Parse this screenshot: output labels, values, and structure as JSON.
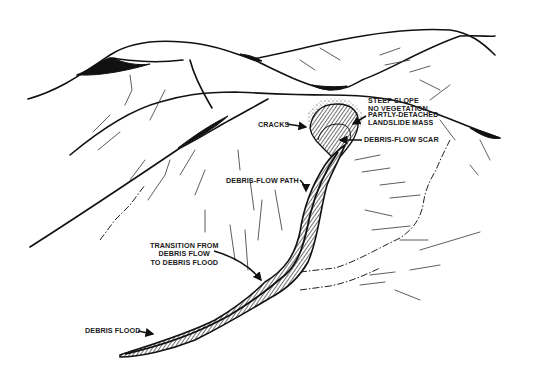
{
  "diagram": {
    "ink_color": "#111111",
    "background": "#ffffff",
    "labels": [
      {
        "id": "steep-slope",
        "text": "STEEP SLOPE\nNO VEGETATION",
        "x": 368,
        "y": 97
      },
      {
        "id": "cracks",
        "text": "CRACKS",
        "x": 258,
        "y": 121
      },
      {
        "id": "partly-detached",
        "text": "PARTLY-DETACHED\nLANDSLIDE MASS",
        "x": 368,
        "y": 111
      },
      {
        "id": "debris-flow-scar",
        "text": "DEBRIS-FLOW SCAR",
        "x": 364,
        "y": 137
      },
      {
        "id": "debris-flow-path",
        "text": "DEBRIS-FLOW PATH",
        "x": 226,
        "y": 178
      },
      {
        "id": "transition",
        "text": "TRANSITION FROM\nDEBRIS FLOW\nTO DEBRIS FLOOD",
        "x": 150,
        "y": 243
      },
      {
        "id": "debris-flood",
        "text": "DEBRIS FLOOD",
        "x": 85,
        "y": 328
      }
    ],
    "arrows": [
      {
        "id": "cracks-arrow",
        "d": "M287,124 L306,127"
      },
      {
        "id": "partly-detached-arrow",
        "d": "M366,116 L353,124"
      },
      {
        "id": "scar-arrow",
        "d": "M362,140 L340,140"
      },
      {
        "id": "path-arrow",
        "d": "M300,180 Q306,186 306,191"
      },
      {
        "id": "transition-arrow",
        "d": "M214,251 Q245,260 261,280"
      },
      {
        "id": "flood-arrow",
        "d": "M138,331 L153,334"
      }
    ],
    "ridges": [
      {
        "id": "back-ridge",
        "d": "M28,99 C60,90 80,75 110,55 C130,42 160,38 200,44 C225,48 240,56 252,59 C280,54 310,46 340,40 C380,32 420,28 450,30 C470,33 482,42 495,55"
      },
      {
        "id": "back-ridge-left-shoulder",
        "d": "M252,59 C280,72 305,86 330,90 C345,90 355,84 362,80 C390,70 420,50 460,36 C480,35 490,37 495,36"
      },
      {
        "id": "middle-ridge",
        "d": "M70,155 C100,130 130,110 160,102 C180,96 200,92 236,92 C260,93 290,95 330,95 C370,95 400,100 420,108 C450,118 470,128 500,138"
      },
      {
        "id": "left-front-ridge",
        "d": "M30,247 C80,215 140,175 180,148 C200,138 215,128 230,120 C245,112 255,106 268,99"
      },
      {
        "id": "left-knoll",
        "d": "M77,75 C90,70 100,62 110,58 C130,60 150,64 183,60"
      },
      {
        "id": "gully-left",
        "d": "M190,60 C195,80 205,96 212,108"
      }
    ],
    "shaded_patches": [
      {
        "id": "saddle-patch-1",
        "d": "M240,54 C247,58 255,62 262,61 C257,58 250,55 240,54 Z"
      },
      {
        "id": "saddle-patch-2",
        "d": "M312,85 C320,90 334,92 347,86 C338,87 325,87 312,85 Z"
      },
      {
        "id": "left-knoll-patch",
        "d": "M80,75 C95,65 108,57 115,58 C120,63 140,66 150,64 C130,70 100,76 80,75 Z"
      },
      {
        "id": "front-ridge-patch",
        "d": "M178,148 C195,135 210,125 228,116 C215,128 195,140 178,148 Z"
      },
      {
        "id": "right-edge-patch",
        "d": "M470,128 C485,132 495,136 500,138 C492,140 482,136 470,128 Z"
      }
    ],
    "scar": {
      "outline": "M310,128 C312,112 322,104 337,104 C352,104 360,112 358,126 C356,140 345,150 336,162 C328,150 312,142 310,128 Z",
      "inner": "M318,140 C320,130 328,124 338,124 C348,124 352,130 350,140"
    },
    "channel": {
      "outer": "M120,355 C150,345 185,335 215,320 C240,305 252,295 265,282 C285,270 295,255 300,232 C304,205 312,185 325,165 C332,155 338,150 345,145 C340,158 333,170 327,185 C320,210 318,240 308,262 C298,280 285,290 270,298 C250,310 225,325 195,340 C170,350 140,357 120,357 Z",
      "center": "M125,354 C165,345 200,332 230,315 C255,300 270,288 285,275 C300,262 305,240 310,215 C315,195 322,175 338,152"
    },
    "hatch_lines": [
      "M93,132 L110,115",
      "M98,150 L120,132",
      "M125,105 L132,90 L130,75",
      "M150,120 L165,90",
      "M130,180 L145,160",
      "M148,200 L165,175 L170,160",
      "M180,175 L195,150",
      "M195,195 L205,170",
      "M238,150 L240,170",
      "M250,180 L254,210",
      "M262,200 L258,240",
      "M275,190 L282,230",
      "M230,225 L235,260",
      "M245,230 L248,270",
      "M205,210 L205,232",
      "M355,160 L380,155",
      "M362,172 L390,168",
      "M380,185 L405,182",
      "M390,198 L420,195",
      "M365,210 L392,216",
      "M372,230 L410,226",
      "M400,240 L428,240",
      "M420,250 L480,232",
      "M410,270 L440,265",
      "M370,275 L395,272",
      "M360,285 L385,282",
      "M395,290 L420,300",
      "M430,100 L450,85",
      "M440,120 L455,140",
      "M480,140 L490,160",
      "M470,165 L478,175",
      "M380,55 L400,48",
      "M385,65 L410,60",
      "M410,72 L430,66",
      "M300,60 L315,70",
      "M320,48 L340,60",
      "M420,80 L440,90"
    ],
    "dash_lines": [
      "M300,272 L335,268 C355,262 375,250 400,238 C412,230 420,220 423,205 C425,190 430,180 436,170 C440,160 445,150 450,140",
      "M300,290 L330,286 C350,282 365,275 380,268",
      "M100,240 L115,220 L130,205 L145,185"
    ]
  }
}
